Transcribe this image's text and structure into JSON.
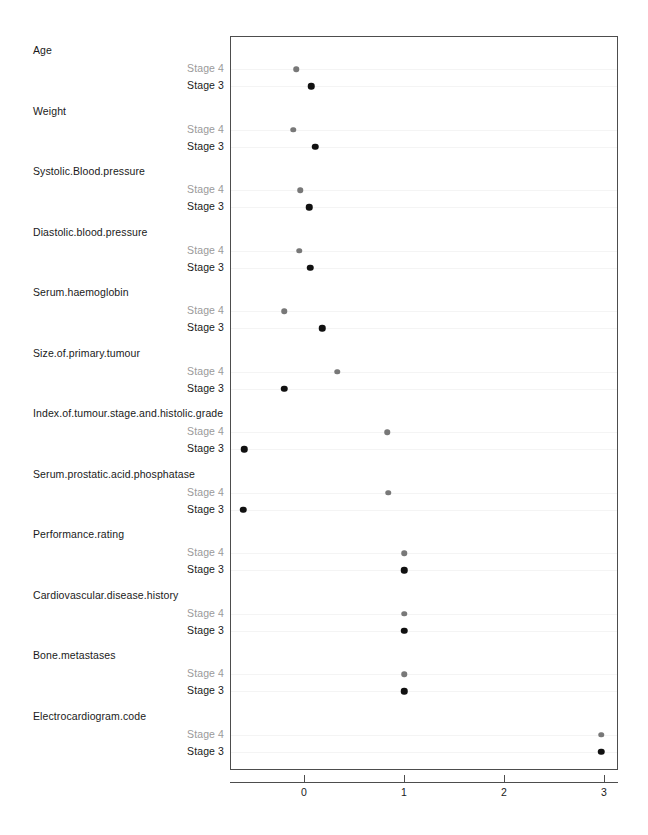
{
  "chart_data": {
    "type": "scatter",
    "title": "",
    "subtitle": "",
    "xlabel": "",
    "ylabel": "",
    "xlim": [
      -0.74,
      3.14
    ],
    "xticks": [
      0,
      1,
      2,
      3
    ],
    "xtick_labels": [
      "0",
      "1",
      "2",
      "3"
    ],
    "grid": false,
    "legend_position": "none",
    "series": [
      {
        "name": "Stage 4",
        "color": "#787878"
      },
      {
        "name": "Stage 3",
        "color": "#111111"
      }
    ],
    "categories": [
      "Age",
      "Weight",
      "Systolic.Blood.pressure",
      "Diastolic.blood.pressure",
      "Serum.haemoglobin",
      "Size.of.primary.tumour",
      "Index.of.tumour.stage.and.histolic.grade",
      "Serum.prostatic.acid.phosphatase",
      "Performance.rating",
      "Cardiovascular.disease.history",
      "Bone.metastases",
      "Electrocardiogram.code"
    ],
    "rows": [
      {
        "variable": "Age",
        "stage4": -0.08,
        "stage3": 0.07
      },
      {
        "variable": "Weight",
        "stage4": -0.11,
        "stage3": 0.11
      },
      {
        "variable": "Systolic.Blood.pressure",
        "stage4": -0.04,
        "stage3": 0.05
      },
      {
        "variable": "Diastolic.blood.pressure",
        "stage4": -0.05,
        "stage3": 0.06
      },
      {
        "variable": "Serum.haemoglobin",
        "stage4": -0.2,
        "stage3": 0.18
      },
      {
        "variable": "Size.of.primary.tumour",
        "stage4": 0.33,
        "stage3": -0.2
      },
      {
        "variable": "Index.of.tumour.stage.and.histolic.grade",
        "stage4": 0.83,
        "stage3": -0.6
      },
      {
        "variable": "Serum.prostatic.acid.phosphatase",
        "stage4": 0.84,
        "stage3": -0.61
      },
      {
        "variable": "Performance.rating",
        "stage4": 1.0,
        "stage3": 1.0
      },
      {
        "variable": "Cardiovascular.disease.history",
        "stage4": 1.0,
        "stage3": 1.0
      },
      {
        "variable": "Bone.metastases",
        "stage4": 1.0,
        "stage3": 1.0
      },
      {
        "variable": "Electrocardiogram.code",
        "stage4": 2.97,
        "stage3": 2.97
      }
    ],
    "stage4_label": "Stage 4",
    "stage3_label": "Stage 3"
  },
  "geometry": {
    "panel_left": 230,
    "panel_top": 36,
    "panel_width": 388,
    "panel_height": 734,
    "x_zero_px": 304,
    "x_unit_px": 100,
    "row_height": 60.5,
    "first_stage4_y": 69,
    "stage_gap": 17
  }
}
